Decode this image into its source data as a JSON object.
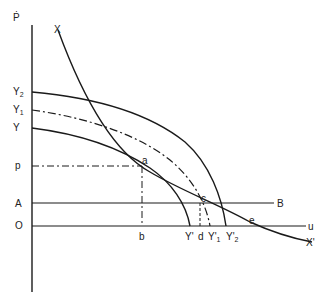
{
  "diagram": {
    "axes": {
      "vertical_label": "Ṗ",
      "origin_label": "O",
      "horizontal_end_label": "u"
    },
    "vertical_labels": {
      "y2": "Y",
      "y2_sub": "2",
      "y1": "Y",
      "y1_sub": "1",
      "y": "Y",
      "p": "p",
      "a": "A",
      "o": "O"
    },
    "horizontal_labels": {
      "b": "b",
      "y_prime": "Y'",
      "d": "d",
      "y1_prime": "Y'",
      "y1_prime_sub": "1",
      "y2_prime": "Y'",
      "y2_prime_sub": "2",
      "e": "e",
      "u": "u"
    },
    "curve_labels": {
      "x": "X",
      "x_prime": "X'",
      "b_line": "B"
    },
    "point_labels": {
      "a": "a",
      "c": "c"
    },
    "colors": {
      "line": "#1a1a1a",
      "text": "#222222",
      "background": "#ffffff"
    }
  }
}
